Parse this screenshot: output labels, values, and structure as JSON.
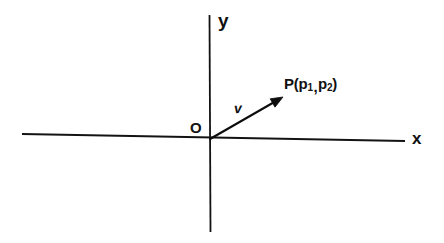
{
  "figure": {
    "background_color": "#ffffff",
    "ink_color": "#111111",
    "width": 444,
    "height": 243
  },
  "axes": {
    "x_axis": {
      "label": "x",
      "name": "x-axis",
      "x1": 22,
      "y1": 134,
      "x2": 405,
      "y2": 141,
      "stroke_width": 1.8
    },
    "y_axis": {
      "label": "y",
      "name": "y-axis",
      "x1": 209,
      "y1": 15,
      "x2": 211,
      "y2": 232,
      "stroke_width": 1.8
    },
    "origin": {
      "label": "O",
      "x": 210,
      "y": 139
    }
  },
  "vector": {
    "label": "v",
    "from_x": 210,
    "from_y": 139,
    "to_x": 283,
    "to_y": 97,
    "stroke_width": 2.1,
    "arrowhead_size": 12
  },
  "point": {
    "name": "P",
    "open_paren": "(",
    "comp1_base": "p",
    "comp1_sub": "1",
    "comma": ",",
    "comp2_base": "p",
    "comp2_sub": "2",
    "close_paren": ")",
    "full_label": "P(p1,p2)",
    "x": 283,
    "y": 97
  },
  "chart_data": {
    "type": "scatter",
    "xlabel": "x",
    "ylabel": "y",
    "grid": false,
    "legend": null,
    "axis_origin_label": "O",
    "annotations": [
      {
        "text": "y",
        "role": "axis-label",
        "px": 222,
        "py": 22
      },
      {
        "text": "x",
        "role": "axis-label",
        "px": 418,
        "py": 140
      },
      {
        "text": "O",
        "role": "origin-label",
        "px": 196,
        "py": 130
      },
      {
        "text": "v",
        "role": "vector-label",
        "px": 240,
        "py": 110
      },
      {
        "text": "P(p1,p2)",
        "role": "point-label",
        "px": 290,
        "py": 87
      }
    ],
    "series": [
      {
        "name": "v",
        "kind": "vector",
        "start": [
          0,
          0
        ],
        "end": [
          73,
          42
        ],
        "label": "v"
      }
    ],
    "points": [
      {
        "label": "O",
        "x": 0,
        "y": 0
      },
      {
        "label": "P(p1,p2)",
        "x": 73,
        "y": 42
      }
    ]
  }
}
